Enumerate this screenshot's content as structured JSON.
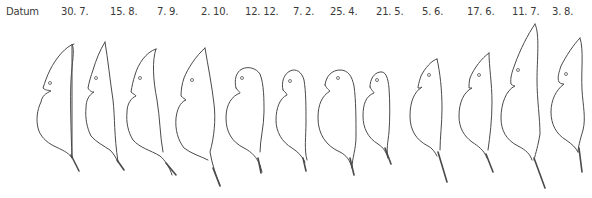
{
  "figure": {
    "row_label": "Datum",
    "dates": [
      "30. 7.",
      "15. 8.",
      "7. 9.",
      "2. 10.",
      "12. 12.",
      "7. 2.",
      "25. 4.",
      "21. 5.",
      "5. 6.",
      "17. 6.",
      "11. 7.",
      "3. 8."
    ],
    "specimens": [
      {
        "date": "30. 7.",
        "helmet": "tall"
      },
      {
        "date": "15. 8.",
        "helmet": "tall"
      },
      {
        "date": "7. 9.",
        "helmet": "medium"
      },
      {
        "date": "2. 10.",
        "helmet": "tall"
      },
      {
        "date": "12. 12.",
        "helmet": "round"
      },
      {
        "date": "7. 2.",
        "helmet": "round"
      },
      {
        "date": "25. 4.",
        "helmet": "round"
      },
      {
        "date": "21. 5.",
        "helmet": "round"
      },
      {
        "date": "5. 6.",
        "helmet": "low"
      },
      {
        "date": "17. 6.",
        "helmet": "medium"
      },
      {
        "date": "11. 7.",
        "helmet": "very tall"
      },
      {
        "date": "3. 8.",
        "helmet": "tall"
      }
    ]
  }
}
